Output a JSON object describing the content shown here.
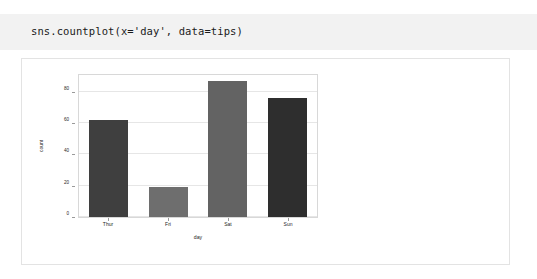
{
  "code_cell": {
    "code": "sns.countplot(x='day', data=tips)"
  },
  "chart_data": {
    "type": "bar",
    "title": "",
    "xlabel": "day",
    "ylabel": "count",
    "categories": [
      "Thur",
      "Fri",
      "Sat",
      "Sun"
    ],
    "values": [
      62,
      19,
      87,
      76
    ],
    "ylim": [
      0,
      92
    ],
    "yticks": [
      0,
      20,
      40,
      60,
      80
    ],
    "ytick_labels": [
      "0",
      "20",
      "40",
      "60",
      "80"
    ],
    "grid": true,
    "legend": "none",
    "bar_colors": [
      "#3f3f3f",
      "#6e6e6e",
      "#636363",
      "#2e2e2e"
    ]
  }
}
